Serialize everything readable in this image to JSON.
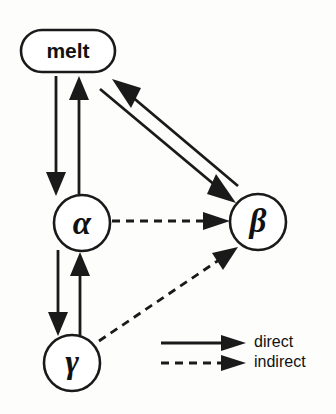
{
  "diagram": {
    "title": "",
    "background_color": "#fdfdfc",
    "ink_color": "#1a1a1a",
    "nodes": [
      {
        "id": "melt",
        "label": "melt",
        "shape": "stadium",
        "cx": 68,
        "cy": 51,
        "rx": 47,
        "ry": 21
      },
      {
        "id": "alpha",
        "label": "α",
        "shape": "circle",
        "cx": 82,
        "cy": 223,
        "r": 28
      },
      {
        "id": "beta",
        "label": "β",
        "shape": "circle",
        "cx": 258,
        "cy": 222,
        "r": 28
      },
      {
        "id": "gamma",
        "label": "γ",
        "shape": "circle",
        "cx": 72,
        "cy": 363,
        "r": 28
      }
    ],
    "edges": [
      {
        "id": "melt-to-alpha",
        "from": "melt",
        "to": "alpha",
        "style": "direct",
        "kind": "vertical-down"
      },
      {
        "id": "alpha-to-melt",
        "from": "alpha",
        "to": "melt",
        "style": "direct",
        "kind": "vertical-up"
      },
      {
        "id": "melt-to-beta",
        "from": "melt",
        "to": "beta",
        "style": "direct",
        "kind": "diagonal-down-right"
      },
      {
        "id": "beta-to-melt",
        "from": "beta",
        "to": "melt",
        "style": "direct",
        "kind": "diagonal-up-left"
      },
      {
        "id": "alpha-to-gamma",
        "from": "alpha",
        "to": "gamma",
        "style": "direct",
        "kind": "vertical-down"
      },
      {
        "id": "gamma-to-alpha",
        "from": "gamma",
        "to": "alpha",
        "style": "direct",
        "kind": "vertical-up"
      },
      {
        "id": "alpha-to-beta",
        "from": "alpha",
        "to": "beta",
        "style": "indirect",
        "kind": "horizontal-right"
      },
      {
        "id": "gamma-to-beta",
        "from": "gamma",
        "to": "beta",
        "style": "indirect",
        "kind": "diagonal-up-right"
      }
    ]
  },
  "legend": {
    "items": [
      {
        "id": "direct",
        "label": "direct",
        "style": "solid"
      },
      {
        "id": "indirect",
        "label": "indirect",
        "style": "dashed"
      }
    ]
  }
}
